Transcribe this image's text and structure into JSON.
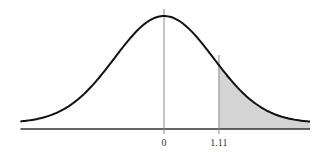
{
  "chart_data": {
    "type": "area",
    "title": "",
    "subtitle": "",
    "xlabel": "",
    "ylabel": "",
    "distribution": {
      "name": "standard normal",
      "mean": 0,
      "sd": 1
    },
    "xlim": [
      -2.9,
      2.95
    ],
    "ticks": [
      {
        "value": 0,
        "label": "0"
      },
      {
        "value": 1.11,
        "label": "1.11"
      }
    ],
    "shaded_region": {
      "from": 1.11,
      "to": 2.95,
      "fill": "#d4d4d4"
    },
    "vertical_lines": [
      0,
      1.11
    ],
    "grid": false,
    "legend": null
  },
  "colors": {
    "curve": "#111111",
    "axis": "#333333",
    "vline": "#888888",
    "shade": "#d4d4d4",
    "background": "#ffffff"
  },
  "labels": {
    "tick_zero": "0",
    "tick_z": "1.11"
  }
}
